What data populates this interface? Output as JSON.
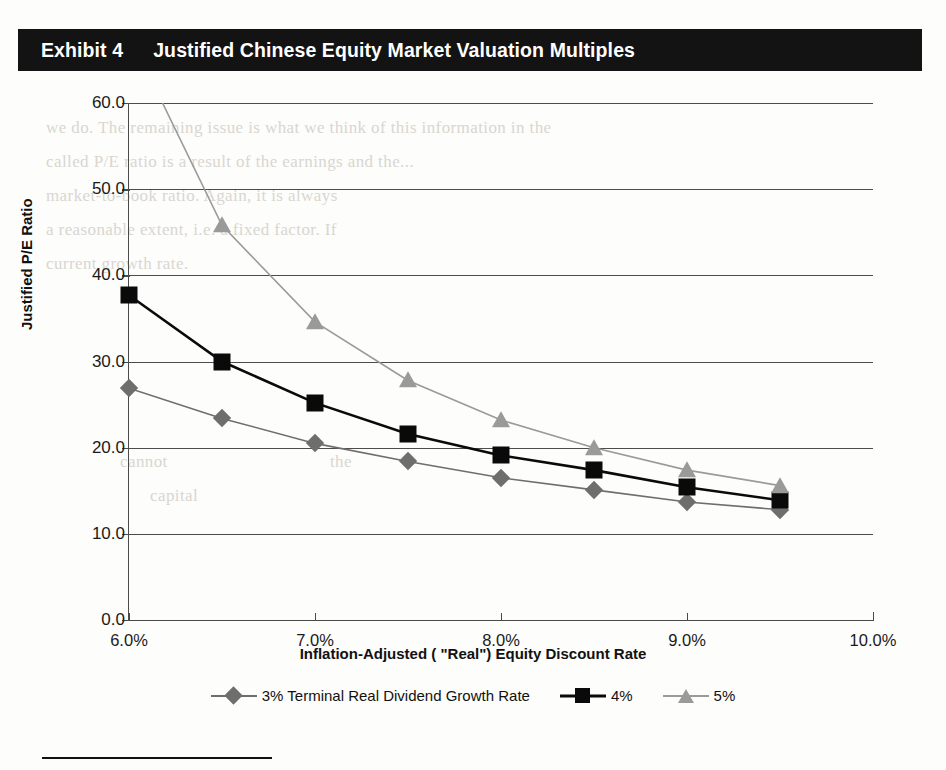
{
  "exhibit": {
    "number_label": "Exhibit 4",
    "title": "Justified Chinese Equity Market Valuation Multiples"
  },
  "colors": {
    "banner_background": "#131313",
    "banner_text": "#ffffff",
    "series_3pct": "#6e6e6e",
    "series_4pct": "#0a0a0a",
    "series_5pct": "#9a9a9a",
    "gridline": "#4c4c4c",
    "axis": "#4a4a4a",
    "page_background": "#ffffff"
  },
  "bleed_text": {
    "l1": "we do. The remaining issue is what we think of this information in the",
    "l2": "called P/E ratio is a result of the earnings and the...",
    "l3": "market-to-book ratio. Again, it is always",
    "l4": "a reasonable extent, i.e. a fixed factor. If",
    "l5": "current growth rate.",
    "l6": "cannot",
    "l7": "the",
    "l8": "capital"
  },
  "chart_data": {
    "type": "line",
    "title": "Justified Chinese Equity Market Valuation Multiples",
    "xlabel": "Inflation-Adjusted ( \"Real\") Equity Discount Rate",
    "ylabel": "Justified P/E Ratio",
    "x": [
      6.0,
      6.5,
      7.0,
      7.5,
      8.0,
      8.5,
      9.0,
      9.5
    ],
    "x_tick_labels": [
      "6.0%",
      "7.0%",
      "8.0%",
      "9.0%",
      "10.0%"
    ],
    "x_tick_values": [
      6.0,
      7.0,
      8.0,
      9.0,
      10.0
    ],
    "xlim": [
      6.0,
      10.0
    ],
    "y_tick_labels": [
      "0.0",
      "10.0",
      "20.0",
      "30.0",
      "40.0",
      "50.0",
      "60.0"
    ],
    "y_tick_values": [
      0.0,
      10.0,
      20.0,
      30.0,
      40.0,
      50.0,
      60.0
    ],
    "ylim": [
      0.0,
      60.0
    ],
    "grid": "horizontal",
    "legend_position": "bottom",
    "series": [
      {
        "name": "3% Terminal Real Dividend Growth Rate",
        "marker": "diamond",
        "color": "#6e6e6e",
        "values": [
          26.9,
          23.4,
          20.5,
          18.4,
          16.5,
          15.1,
          13.7,
          12.8
        ]
      },
      {
        "name": "4%",
        "marker": "square",
        "color": "#0a0a0a",
        "values": [
          37.7,
          30.0,
          25.2,
          21.6,
          19.1,
          17.4,
          15.4,
          13.9
        ]
      },
      {
        "name": "5%",
        "marker": "triangle",
        "color": "#9a9a9a",
        "values": [
          68.0,
          45.8,
          34.6,
          27.8,
          23.2,
          20.0,
          17.4,
          15.6
        ]
      }
    ]
  }
}
